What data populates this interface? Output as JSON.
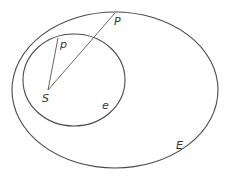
{
  "diagram": {
    "labels": {
      "P": "P",
      "p": "p",
      "S": "S",
      "e": "e",
      "E": "E"
    },
    "shapes": {
      "outer_ellipse": {
        "cx": 115,
        "cy": 90,
        "rx": 103,
        "ry": 78,
        "label": "E"
      },
      "inner_ellipse": {
        "cx": 74,
        "cy": 80,
        "rx": 51,
        "ry": 46,
        "label": "e"
      }
    },
    "points": {
      "S": {
        "x": 48,
        "y": 90
      },
      "p": {
        "x": 58,
        "y": 38
      },
      "P": {
        "x": 115,
        "y": 13
      }
    },
    "segments": [
      {
        "from": "S",
        "to": "p"
      },
      {
        "from": "S",
        "to": "P"
      }
    ],
    "colors": {
      "stroke": "#4a4a4a",
      "text": "#333333",
      "background": "#ffffff"
    }
  }
}
